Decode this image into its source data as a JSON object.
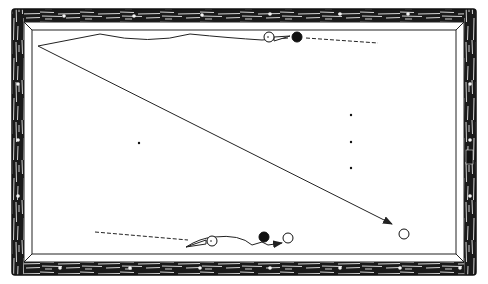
{
  "diagram": {
    "type": "billiards-shot-diagram",
    "colors": {
      "background": "#ffffff",
      "rail_wood_dark": "#1a1a1a",
      "rail_wood_light": "#e8e8e8",
      "cloth": "#ffffff",
      "line": "#222222"
    },
    "table": {
      "outer": {
        "x": 12,
        "y": 9,
        "w": 464,
        "h": 266
      },
      "inner_cushion": {
        "x": 24,
        "y": 22,
        "w": 440,
        "h": 240
      },
      "playing_surface": {
        "x": 32,
        "y": 30,
        "w": 424,
        "h": 224
      }
    },
    "diamonds": {
      "top": [
        [
          64,
          16
        ],
        [
          134,
          16
        ],
        [
          202,
          15
        ],
        [
          270,
          14
        ],
        [
          340,
          14
        ],
        [
          408,
          14
        ]
      ],
      "bottom": [
        [
          60,
          268
        ],
        [
          130,
          268
        ],
        [
          200,
          268
        ],
        [
          270,
          268
        ],
        [
          340,
          268
        ],
        [
          400,
          268
        ],
        [
          460,
          268
        ]
      ],
      "left": [
        [
          18,
          84
        ],
        [
          18,
          140
        ],
        [
          18,
          196
        ]
      ],
      "right": [
        [
          470,
          84
        ],
        [
          470,
          140
        ],
        [
          470,
          196
        ]
      ]
    },
    "spots": [
      {
        "x": 139,
        "y": 143
      },
      {
        "x": 351,
        "y": 115
      },
      {
        "x": 351,
        "y": 142
      },
      {
        "x": 351,
        "y": 168
      }
    ],
    "top_shot": {
      "cue_ball": {
        "x": 269,
        "y": 37,
        "r": 5
      },
      "object_ball_black": {
        "x": 297,
        "y": 37,
        "r": 5
      },
      "aim_line": {
        "from": [
          306,
          38
        ],
        "to": [
          378,
          43
        ]
      },
      "cue_stick_path": "M 38 46 L 100 34 Q 150 45 190 34 Q 230 38 262 40 L 288 38"
    },
    "long_shot": {
      "path_from": [
        38,
        46
      ],
      "path_to": [
        392,
        224
      ],
      "arrow_at": [
        392,
        224
      ]
    },
    "target_ball": {
      "x": 404,
      "y": 234,
      "r": 5
    },
    "bottom_shot": {
      "aim_line": {
        "from": [
          95,
          232
        ],
        "to": [
          188,
          240
        ]
      },
      "cue_ball": {
        "x": 212,
        "y": 241,
        "r": 5
      },
      "object_ball_black": {
        "x": 264,
        "y": 237,
        "r": 5
      },
      "second_ball": {
        "x": 288,
        "y": 238,
        "r": 5
      },
      "cue_stick_path": "M 186 247 Q 200 238 214 237 Q 240 234 252 245 L 262 242 L 268 245 L 282 243",
      "arrow_at": [
        282,
        243
      ]
    },
    "rail_mark": {
      "x": 466,
      "y": 150,
      "w": 7,
      "h": 14
    }
  }
}
